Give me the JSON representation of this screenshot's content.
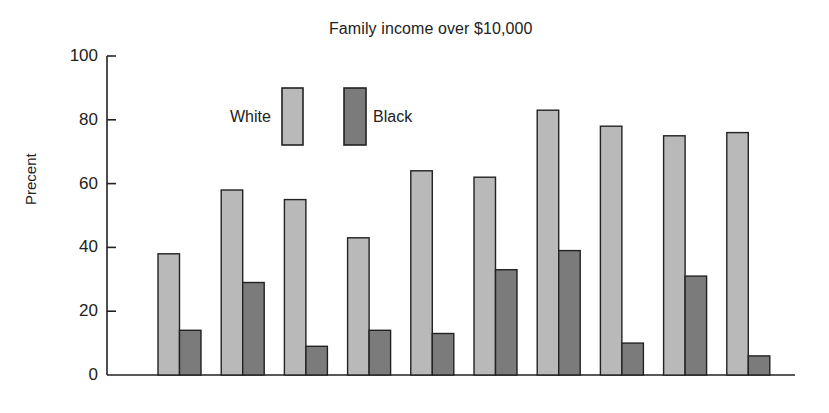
{
  "chart_data": {
    "type": "bar",
    "title": "Family income over $10,000",
    "xlabel": "",
    "ylabel": "Precent",
    "ylim": [
      0,
      100
    ],
    "yticks": [
      0,
      20,
      40,
      60,
      80,
      100
    ],
    "grid": false,
    "legend_position": "upper-left inside plot",
    "categories": [
      "1",
      "2",
      "3",
      "4",
      "5",
      "6",
      "7",
      "8",
      "9",
      "10"
    ],
    "category_labels_visible": false,
    "series": [
      {
        "name": "White",
        "color": "#b9b9b9",
        "values": [
          38,
          58,
          55,
          43,
          64,
          62,
          83,
          78,
          75,
          76
        ]
      },
      {
        "name": "Black",
        "color": "#7b7b7b",
        "values": [
          14,
          29,
          9,
          14,
          13,
          33,
          39,
          10,
          31,
          6
        ]
      }
    ]
  },
  "labels": {
    "title": "Family income over $10,000",
    "ylabel": "Precent",
    "legend_white": "White",
    "legend_black": "Black",
    "yticks": [
      "0",
      "20",
      "40",
      "60",
      "80",
      "100"
    ]
  }
}
